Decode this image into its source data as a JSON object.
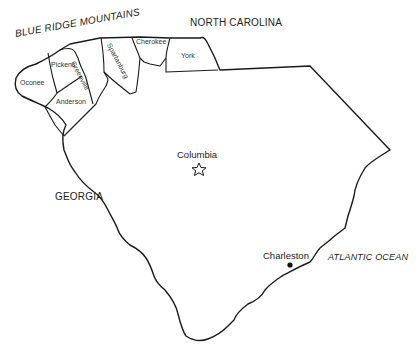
{
  "map": {
    "title": "South Carolina",
    "colors": {
      "outline": "#1a1a1a",
      "background": "#ffffff",
      "text": "#222222"
    },
    "regions": {
      "mountains": "BLUE RIDGE MOUNTAINS",
      "north": "NORTH CAROLINA",
      "west": "GEORGIA",
      "ocean": "ATLANTIC OCEAN"
    },
    "counties": [
      {
        "name": "Oconee"
      },
      {
        "name": "Pickens"
      },
      {
        "name": "Greenville"
      },
      {
        "name": "Spartanburg"
      },
      {
        "name": "Cherokee"
      },
      {
        "name": "York"
      },
      {
        "name": "Anderson"
      }
    ],
    "cities": [
      {
        "name": "Columbia",
        "marker": "star-icon",
        "type": "capital"
      },
      {
        "name": "Charleston",
        "marker": "dot-icon",
        "type": "city"
      }
    ]
  }
}
